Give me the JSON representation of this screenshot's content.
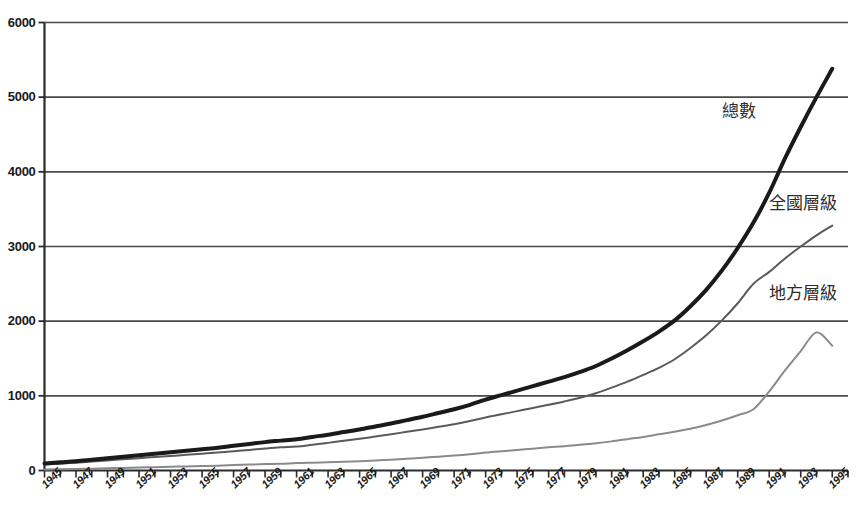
{
  "chart_data": {
    "type": "line",
    "title": "",
    "subtitle": "",
    "xlabel": "",
    "ylabel": "",
    "xlim": [
      1945,
      1996
    ],
    "ylim": [
      0,
      6000
    ],
    "grid": "horizontal",
    "legend_position": "inline-annotation",
    "y_ticks": [
      0,
      1000,
      2000,
      3000,
      4000,
      5000,
      6000
    ],
    "y_tick_labels": [
      "0",
      "1000",
      "2000",
      "3000",
      "4000",
      "5000",
      "6000"
    ],
    "x_ticks": [
      1945,
      1946,
      1947,
      1948,
      1949,
      1950,
      1951,
      1952,
      1953,
      1954,
      1955,
      1956,
      1957,
      1958,
      1959,
      1960,
      1961,
      1962,
      1963,
      1964,
      1965,
      1966,
      1967,
      1968,
      1969,
      1970,
      1971,
      1972,
      1973,
      1974,
      1975,
      1976,
      1977,
      1978,
      1979,
      1980,
      1981,
      1982,
      1983,
      1984,
      1985,
      1986,
      1987,
      1988,
      1989,
      1990,
      1991,
      1992,
      1993,
      1994,
      1995,
      1996
    ],
    "x_tick_labels": [
      "1945",
      "1947",
      "1949",
      "1951",
      "1953",
      "1955",
      "1957",
      "1959",
      "1961",
      "1963",
      "1965",
      "1967",
      "1969",
      "1971",
      "1973",
      "1975",
      "1977",
      "1979",
      "1981",
      "1983",
      "1985",
      "1987",
      "1989",
      "1991",
      "1993",
      "1995"
    ],
    "x_tick_label_years": [
      1945,
      1947,
      1949,
      1951,
      1953,
      1955,
      1957,
      1959,
      1961,
      1963,
      1965,
      1967,
      1969,
      1971,
      1973,
      1975,
      1977,
      1979,
      1981,
      1983,
      1985,
      1987,
      1989,
      1991,
      1993,
      1995
    ],
    "x": [
      1945,
      1946,
      1947,
      1948,
      1949,
      1950,
      1951,
      1952,
      1953,
      1954,
      1955,
      1956,
      1957,
      1958,
      1959,
      1960,
      1961,
      1962,
      1963,
      1964,
      1965,
      1966,
      1967,
      1968,
      1969,
      1970,
      1971,
      1972,
      1973,
      1974,
      1975,
      1976,
      1977,
      1978,
      1979,
      1980,
      1981,
      1982,
      1983,
      1984,
      1985,
      1986,
      1987,
      1988,
      1989,
      1990,
      1991,
      1992,
      1993,
      1994,
      1995
    ],
    "series": [
      {
        "name": "總數",
        "color": "#1a1a1a",
        "width": 4,
        "label_x": 1988,
        "label_y": 4850,
        "values": [
          95,
          110,
          125,
          145,
          165,
          185,
          205,
          225,
          245,
          265,
          285,
          305,
          330,
          355,
          380,
          400,
          420,
          450,
          480,
          515,
          550,
          590,
          630,
          675,
          720,
          770,
          820,
          880,
          950,
          1010,
          1070,
          1130,
          1190,
          1250,
          1320,
          1400,
          1500,
          1610,
          1730,
          1860,
          2010,
          2200,
          2420,
          2680,
          2980,
          3320,
          3720,
          4180,
          4600,
          5000,
          5380
        ]
      },
      {
        "name": "全國層級",
        "color": "#5a5a5a",
        "width": 2,
        "label_x": 1991,
        "label_y": 3620,
        "values": [
          80,
          92,
          105,
          120,
          135,
          150,
          165,
          180,
          195,
          210,
          225,
          240,
          258,
          276,
          294,
          310,
          320,
          345,
          370,
          398,
          425,
          455,
          485,
          518,
          550,
          585,
          620,
          662,
          710,
          752,
          795,
          838,
          880,
          925,
          975,
          1035,
          1110,
          1190,
          1280,
          1375,
          1490,
          1640,
          1810,
          2010,
          2240,
          2500,
          2660,
          2840,
          3000,
          3150,
          3280
        ]
      },
      {
        "name": "地方層級",
        "color": "#8a8a8a",
        "width": 2,
        "label_x": 1991,
        "label_y": 2420,
        "values": [
          15,
          18,
          20,
          25,
          30,
          35,
          40,
          45,
          50,
          55,
          60,
          65,
          72,
          79,
          86,
          90,
          100,
          105,
          110,
          117,
          125,
          135,
          145,
          157,
          170,
          185,
          200,
          218,
          240,
          258,
          275,
          292,
          310,
          325,
          345,
          365,
          390,
          420,
          450,
          485,
          520,
          560,
          610,
          670,
          740,
          820,
          1060,
          1340,
          1600,
          1850,
          1670
        ]
      }
    ]
  },
  "annotations": {
    "total": "總數",
    "national": "全國層級",
    "local": "地方層級"
  },
  "axis_colors": {
    "axis_line": "#2b2b2b",
    "gridline": "#4a4a4a",
    "background": "#ffffff"
  }
}
